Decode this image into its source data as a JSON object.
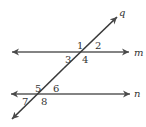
{
  "diagram": {
    "lines": {
      "m": {
        "label": "m",
        "type": "line",
        "color": "#5a5a5a"
      },
      "n": {
        "label": "n",
        "type": "line",
        "color": "#5a5a5a"
      },
      "q": {
        "label": "q",
        "type": "transversal",
        "color": "#3a3a3a"
      }
    },
    "angles": [
      {
        "label": "1",
        "position": "above-left of m∩q"
      },
      {
        "label": "2",
        "position": "above-right of m∩q"
      },
      {
        "label": "3",
        "position": "below-left of m∩q"
      },
      {
        "label": "4",
        "position": "below-right of m∩q"
      },
      {
        "label": "5",
        "position": "above-left of n∩q"
      },
      {
        "label": "6",
        "position": "above-right of n∩q"
      },
      {
        "label": "7",
        "position": "below-left of n∩q"
      },
      {
        "label": "8",
        "position": "below-right of n∩q"
      }
    ]
  }
}
